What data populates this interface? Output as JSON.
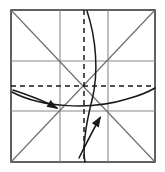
{
  "figure": {
    "kind": "origami-crease-pattern",
    "title": "",
    "canvas": {
      "width": 165,
      "height": 172,
      "background": "#ffffff"
    }
  },
  "colors": {
    "paper_border": "#3a3a3a",
    "grid_line": "#8a8a8a",
    "diagonal_line": "#6f6f6f",
    "valley_fold_dashed": "#1a1a1a",
    "fold_curve": "#1a1a1a",
    "arrow": "#1a1a1a",
    "paper_fill": "#ffffff"
  },
  "paper": {
    "label": "square-sheet",
    "x": 11,
    "y": 10,
    "width": 144,
    "height": 152,
    "stroke_width": 1.6
  },
  "grid": {
    "label": "crease-grid",
    "vertical_x": [
      60,
      108
    ],
    "horizontal_y": [
      61,
      111
    ],
    "stroke_width": 1.1
  },
  "diagonals": [
    {
      "name": "diagonal-tl-br",
      "x1": 11,
      "y1": 10,
      "x2": 155,
      "y2": 162
    },
    {
      "name": "diagonal-bl-tr",
      "x1": 11,
      "y1": 162,
      "x2": 155,
      "y2": 10
    }
  ],
  "valley_folds": [
    {
      "name": "vertical-center-dashed",
      "orientation": "vertical",
      "x1": 84,
      "y1": 10,
      "x2": 84,
      "y2": 162,
      "dash": "5 4",
      "stroke_width": 1.5
    },
    {
      "name": "horizontal-center-dashed",
      "orientation": "horizontal",
      "x1": 11,
      "y1": 86,
      "x2": 155,
      "y2": 86,
      "dash": "5 4",
      "stroke_width": 1.5
    }
  ],
  "fold_curves": [
    {
      "name": "vertical-bowed-fold-curve",
      "path": "M 87 11 C 96 38, 99 72, 92 100 C 86 124, 82 146, 85 162",
      "stroke_width": 1.5
    },
    {
      "name": "horizontal-bowed-fold-curve",
      "path": "M 12 92 C 42 108, 92 110, 127 99 C 142 95, 150 91, 155 88",
      "stroke_width": 1.5
    }
  ],
  "arrows": [
    {
      "name": "arrow-down-right",
      "direction": "down-right",
      "path": "M 13 90 C 28 95, 45 101, 57 108",
      "tip_x": 58,
      "tip_y": 109,
      "angle_deg": 31,
      "stroke_width": 1.5
    },
    {
      "name": "arrow-up-right",
      "direction": "up-right",
      "path": "M 79 158 C 86 144, 94 128, 100 118",
      "tip_x": 101,
      "tip_y": 116,
      "angle_deg": -59,
      "stroke_width": 1.5
    }
  ]
}
